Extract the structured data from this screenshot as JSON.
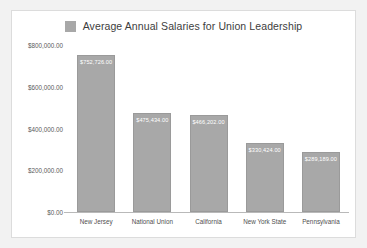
{
  "chart_data": {
    "type": "bar",
    "title": "Average Annual Salaries for Union Leadership",
    "xlabel": "",
    "ylabel": "",
    "grid": false,
    "legend_position": "top-center",
    "legend": [
      "Average Annual Salaries for Union Leadership"
    ],
    "categories": [
      "New Jersey",
      "National Union",
      "California",
      "New York State",
      "Pennsylvania"
    ],
    "values": [
      752726,
      475434,
      466202,
      330424,
      289189
    ],
    "value_labels": [
      "$752,726.00",
      "$475,434.00",
      "$466,202.00",
      "$330,424.00",
      "$289,189.00"
    ],
    "ylim": [
      0,
      800000
    ],
    "ytick_labels": [
      "$800,000.00",
      "$600,000.00",
      "$400,000.00",
      "$200,000.00",
      "$0.00"
    ],
    "ytick_values": [
      800000,
      600000,
      400000,
      200000,
      0
    ],
    "bar_color": "#a8a8a8",
    "bar_border_color": "#9a9a9a",
    "value_label_color": "#ffffff",
    "axis_color": "#b9b9b9",
    "panel_background": "#ffffff",
    "page_background": "#f2f2f2"
  },
  "legend": {
    "swatch_name": "legend-color-swatch"
  }
}
